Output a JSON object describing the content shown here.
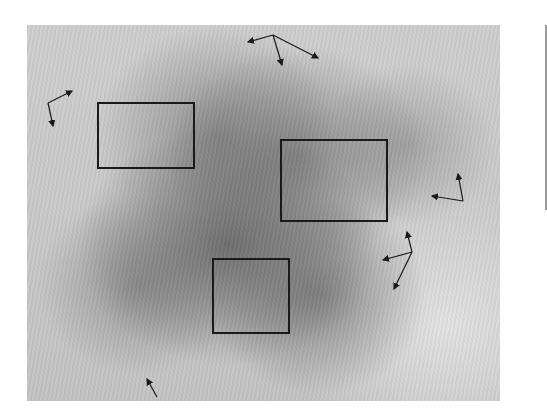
{
  "figure": {
    "colors": {
      "frame": "#1a1a1a",
      "background": "#ffffff",
      "tissue_dark": "#5f5f5f",
      "tissue_light": "#e6e6e6"
    },
    "regions_of_interest": [
      {
        "id": "roi-1",
        "label": ""
      },
      {
        "id": "roi-2",
        "label": ""
      },
      {
        "id": "roi-3",
        "label": ""
      }
    ],
    "arrow_groups": [
      {
        "id": "arrows-top",
        "count": 3
      },
      {
        "id": "arrows-left",
        "count": 2
      },
      {
        "id": "arrows-right-upper",
        "count": 2
      },
      {
        "id": "arrows-right-lower",
        "count": 3
      },
      {
        "id": "arrow-bottom",
        "count": 1
      }
    ]
  }
}
